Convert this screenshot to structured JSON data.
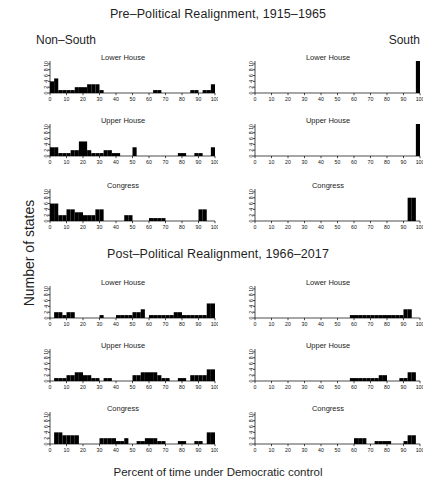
{
  "figure": {
    "ylabel": "Number of states",
    "xlabel": "Percent of time under Democratic control",
    "sections": [
      {
        "title": "Pre–Political Realignment, 1915–1965"
      },
      {
        "title": "Post–Political Realignment, 1966–2017"
      }
    ],
    "column_labels": {
      "left": "Non–South",
      "right": "South"
    },
    "panel_titles": {
      "lower": "Lower House",
      "upper": "Upper House",
      "congress": "Congress"
    }
  },
  "chart_data": [
    {
      "type": "bar",
      "title": "Lower House",
      "subtitle": "Pre–Political Realignment, 1915–1965 — Non–South",
      "xlabel": "Percent of time under Democratic control",
      "ylabel": "Number of states",
      "xlim": [
        0,
        100
      ],
      "ylim": [
        0,
        11
      ],
      "xticks": [
        0,
        10,
        20,
        30,
        40,
        50,
        60,
        70,
        80,
        90,
        100
      ],
      "yticks": [
        0,
        2,
        4,
        6,
        8,
        10
      ],
      "grid": false,
      "bin_width": 2.5,
      "bins": [
        0,
        2.5,
        5,
        7.5,
        10,
        12.5,
        15,
        17.5,
        20,
        22.5,
        25,
        27.5,
        30,
        32.5,
        35,
        37.5,
        40,
        42.5,
        45,
        47.5,
        50,
        52.5,
        55,
        57.5,
        60,
        62.5,
        65,
        67.5,
        70,
        72.5,
        75,
        77.5,
        80,
        82.5,
        85,
        87.5,
        90,
        92.5,
        95,
        97.5
      ],
      "values": [
        4,
        5,
        1,
        1,
        1,
        1,
        2,
        2,
        2,
        3,
        3,
        3,
        1,
        0,
        0,
        0,
        0,
        0,
        0,
        0,
        0,
        0,
        0,
        0,
        0,
        1,
        1,
        0,
        0,
        0,
        0,
        0,
        0,
        0,
        1,
        1,
        0,
        1,
        1,
        3
      ]
    },
    {
      "type": "bar",
      "title": "Lower House",
      "subtitle": "Pre–Political Realignment, 1915–1965 — South",
      "xlabel": "Percent of time under Democratic control",
      "ylabel": "Number of states",
      "xlim": [
        0,
        100
      ],
      "ylim": [
        0,
        11
      ],
      "xticks": [
        0,
        10,
        20,
        30,
        40,
        50,
        60,
        70,
        80,
        90,
        100
      ],
      "yticks": [
        0,
        2,
        4,
        6,
        8,
        10
      ],
      "grid": false,
      "bin_width": 2.5,
      "bins": [
        0,
        2.5,
        5,
        7.5,
        10,
        12.5,
        15,
        17.5,
        20,
        22.5,
        25,
        27.5,
        30,
        32.5,
        35,
        37.5,
        40,
        42.5,
        45,
        47.5,
        50,
        52.5,
        55,
        57.5,
        60,
        62.5,
        65,
        67.5,
        70,
        72.5,
        75,
        77.5,
        80,
        82.5,
        85,
        87.5,
        90,
        92.5,
        95,
        97.5
      ],
      "values": [
        0,
        0,
        0,
        0,
        0,
        0,
        0,
        0,
        0,
        0,
        0,
        0,
        0,
        0,
        0,
        0,
        0,
        0,
        0,
        0,
        0,
        0,
        0,
        0,
        0,
        0,
        0,
        0,
        0,
        0,
        0,
        0,
        0,
        0,
        0,
        0,
        0,
        0,
        0,
        11
      ]
    },
    {
      "type": "bar",
      "title": "Upper House",
      "subtitle": "Pre–Political Realignment, 1915–1965 — Non–South",
      "xlabel": "Percent of time under Democratic control",
      "ylabel": "Number of states",
      "xlim": [
        0,
        100
      ],
      "ylim": [
        0,
        11
      ],
      "xticks": [
        0,
        10,
        20,
        30,
        40,
        50,
        60,
        70,
        80,
        90,
        100
      ],
      "yticks": [
        0,
        2,
        4,
        6,
        8,
        10
      ],
      "grid": false,
      "bin_width": 2.5,
      "bins": [
        0,
        2.5,
        5,
        7.5,
        10,
        12.5,
        15,
        17.5,
        20,
        22.5,
        25,
        27.5,
        30,
        32.5,
        35,
        37.5,
        40,
        42.5,
        45,
        47.5,
        50,
        52.5,
        55,
        57.5,
        60,
        62.5,
        65,
        67.5,
        70,
        72.5,
        75,
        77.5,
        80,
        82.5,
        85,
        87.5,
        90,
        92.5,
        95,
        97.5
      ],
      "values": [
        3,
        3,
        1,
        1,
        1,
        2,
        2,
        5,
        5,
        2,
        1,
        1,
        1,
        2,
        2,
        1,
        1,
        0,
        0,
        0,
        3,
        0,
        0,
        0,
        0,
        0,
        0,
        0,
        0,
        0,
        0,
        1,
        1,
        0,
        0,
        1,
        1,
        0,
        0,
        3
      ]
    },
    {
      "type": "bar",
      "title": "Upper House",
      "subtitle": "Pre–Political Realignment, 1915–1965 — South",
      "xlabel": "Percent of time under Democratic control",
      "ylabel": "Number of states",
      "xlim": [
        0,
        100
      ],
      "ylim": [
        0,
        11
      ],
      "xticks": [
        0,
        10,
        20,
        30,
        40,
        50,
        60,
        70,
        80,
        90,
        100
      ],
      "yticks": [
        0,
        2,
        4,
        6,
        8,
        10
      ],
      "grid": false,
      "bin_width": 2.5,
      "bins": [
        0,
        2.5,
        5,
        7.5,
        10,
        12.5,
        15,
        17.5,
        20,
        22.5,
        25,
        27.5,
        30,
        32.5,
        35,
        37.5,
        40,
        42.5,
        45,
        47.5,
        50,
        52.5,
        55,
        57.5,
        60,
        62.5,
        65,
        67.5,
        70,
        72.5,
        75,
        77.5,
        80,
        82.5,
        85,
        87.5,
        90,
        92.5,
        95,
        97.5
      ],
      "values": [
        0,
        0,
        0,
        0,
        0,
        0,
        0,
        0,
        0,
        0,
        0,
        0,
        0,
        0,
        0,
        0,
        0,
        0,
        0,
        0,
        0,
        0,
        0,
        0,
        0,
        0,
        0,
        0,
        0,
        0,
        0,
        0,
        0,
        0,
        0,
        0,
        0,
        0,
        0,
        11
      ]
    },
    {
      "type": "bar",
      "title": "Congress",
      "subtitle": "Pre–Political Realignment, 1915–1965 — Non–South",
      "xlabel": "Percent of time under Democratic control",
      "ylabel": "Number of states",
      "xlim": [
        0,
        100
      ],
      "ylim": [
        0,
        11
      ],
      "xticks": [
        0,
        10,
        20,
        30,
        40,
        50,
        60,
        70,
        80,
        90,
        100
      ],
      "yticks": [
        0,
        2,
        4,
        6,
        8,
        10
      ],
      "grid": false,
      "bin_width": 2.5,
      "bins": [
        0,
        2.5,
        5,
        7.5,
        10,
        12.5,
        15,
        17.5,
        20,
        22.5,
        25,
        27.5,
        30,
        32.5,
        35,
        37.5,
        40,
        42.5,
        45,
        47.5,
        50,
        52.5,
        55,
        57.5,
        60,
        62.5,
        65,
        67.5,
        70,
        72.5,
        75,
        77.5,
        80,
        82.5,
        85,
        87.5,
        90,
        92.5,
        95,
        97.5
      ],
      "values": [
        6,
        6,
        2,
        2,
        4,
        4,
        3,
        3,
        2,
        2,
        2,
        4,
        4,
        0,
        0,
        0,
        0,
        0,
        2,
        2,
        0,
        0,
        0,
        0,
        1,
        1,
        1,
        1,
        0,
        0,
        0,
        0,
        0,
        0,
        0,
        0,
        4,
        4,
        0,
        0
      ]
    },
    {
      "type": "bar",
      "title": "Congress",
      "subtitle": "Pre–Political Realignment, 1915–1965 — South",
      "xlabel": "Percent of time under Democratic control",
      "ylabel": "Number of states",
      "xlim": [
        0,
        100
      ],
      "ylim": [
        0,
        11
      ],
      "xticks": [
        0,
        10,
        20,
        30,
        40,
        50,
        60,
        70,
        80,
        90,
        100
      ],
      "yticks": [
        0,
        2,
        4,
        6,
        8,
        10
      ],
      "grid": false,
      "bin_width": 2.5,
      "bins": [
        0,
        2.5,
        5,
        7.5,
        10,
        12.5,
        15,
        17.5,
        20,
        22.5,
        25,
        27.5,
        30,
        32.5,
        35,
        37.5,
        40,
        42.5,
        45,
        47.5,
        50,
        52.5,
        55,
        57.5,
        60,
        62.5,
        65,
        67.5,
        70,
        72.5,
        75,
        77.5,
        80,
        82.5,
        85,
        87.5,
        90,
        92.5,
        95,
        97.5
      ],
      "values": [
        0,
        0,
        0,
        0,
        0,
        0,
        0,
        0,
        0,
        0,
        0,
        0,
        0,
        0,
        0,
        0,
        0,
        0,
        0,
        0,
        0,
        0,
        0,
        0,
        0,
        0,
        0,
        0,
        0,
        0,
        0,
        0,
        0,
        0,
        0,
        0,
        0,
        8,
        8,
        0
      ]
    },
    {
      "type": "bar",
      "title": "Lower House",
      "subtitle": "Post–Political Realignment, 1966–2017 — Non–South",
      "xlabel": "Percent of time under Democratic control",
      "ylabel": "Number of states",
      "xlim": [
        0,
        100
      ],
      "ylim": [
        0,
        11
      ],
      "xticks": [
        0,
        10,
        20,
        30,
        40,
        50,
        60,
        70,
        80,
        90,
        100
      ],
      "yticks": [
        0,
        2,
        4,
        6,
        8,
        10
      ],
      "grid": false,
      "bin_width": 2.5,
      "bins": [
        0,
        2.5,
        5,
        7.5,
        10,
        12.5,
        15,
        17.5,
        20,
        22.5,
        25,
        27.5,
        30,
        32.5,
        35,
        37.5,
        40,
        42.5,
        45,
        47.5,
        50,
        52.5,
        55,
        57.5,
        60,
        62.5,
        65,
        67.5,
        70,
        72.5,
        75,
        77.5,
        80,
        82.5,
        85,
        87.5,
        90,
        92.5,
        95,
        97.5
      ],
      "values": [
        0,
        2,
        2,
        1,
        2,
        2,
        0,
        0,
        0,
        0,
        0,
        0,
        1,
        0,
        0,
        0,
        1,
        1,
        1,
        1,
        2,
        2,
        3,
        0,
        1,
        1,
        1,
        1,
        1,
        1,
        2,
        2,
        1,
        1,
        1,
        1,
        1,
        1,
        5,
        5
      ]
    },
    {
      "type": "bar",
      "title": "Lower House",
      "subtitle": "Post–Political Realignment, 1966–2017 — South",
      "xlabel": "Percent of time under Democratic control",
      "ylabel": "Number of states",
      "xlim": [
        0,
        100
      ],
      "ylim": [
        0,
        11
      ],
      "xticks": [
        0,
        10,
        20,
        30,
        40,
        50,
        60,
        70,
        80,
        90,
        100
      ],
      "yticks": [
        0,
        2,
        4,
        6,
        8,
        10
      ],
      "grid": false,
      "bin_width": 2.5,
      "bins": [
        0,
        2.5,
        5,
        7.5,
        10,
        12.5,
        15,
        17.5,
        20,
        22.5,
        25,
        27.5,
        30,
        32.5,
        35,
        37.5,
        40,
        42.5,
        45,
        47.5,
        50,
        52.5,
        55,
        57.5,
        60,
        62.5,
        65,
        67.5,
        70,
        72.5,
        75,
        77.5,
        80,
        82.5,
        85,
        87.5,
        90,
        92.5,
        95,
        97.5
      ],
      "values": [
        0,
        0,
        0,
        0,
        0,
        0,
        0,
        0,
        0,
        0,
        0,
        0,
        0,
        0,
        0,
        0,
        0,
        0,
        0,
        0,
        0,
        0,
        0,
        1,
        1,
        1,
        1,
        1,
        1,
        1,
        1,
        1,
        1,
        1,
        1,
        1,
        3,
        3,
        0,
        0
      ]
    },
    {
      "type": "bar",
      "title": "Upper House",
      "subtitle": "Post–Political Realignment, 1966–2017 — Non–South",
      "xlabel": "Percent of time under Democratic control",
      "ylabel": "Number of states",
      "xlim": [
        0,
        100
      ],
      "ylim": [
        0,
        11
      ],
      "xticks": [
        0,
        10,
        20,
        30,
        40,
        50,
        60,
        70,
        80,
        90,
        100
      ],
      "yticks": [
        0,
        2,
        4,
        6,
        8,
        10
      ],
      "grid": false,
      "bin_width": 2.5,
      "bins": [
        0,
        2.5,
        5,
        7.5,
        10,
        12.5,
        15,
        17.5,
        20,
        22.5,
        25,
        27.5,
        30,
        32.5,
        35,
        37.5,
        40,
        42.5,
        45,
        47.5,
        50,
        52.5,
        55,
        57.5,
        60,
        62.5,
        65,
        67.5,
        70,
        72.5,
        75,
        77.5,
        80,
        82.5,
        85,
        87.5,
        90,
        92.5,
        95,
        97.5
      ],
      "values": [
        0,
        1,
        1,
        1,
        2,
        2,
        3,
        3,
        2,
        2,
        1,
        1,
        0,
        1,
        1,
        0,
        0,
        0,
        0,
        0,
        2,
        2,
        3,
        3,
        3,
        3,
        2,
        1,
        1,
        0,
        0,
        1,
        1,
        0,
        2,
        2,
        2,
        2,
        4,
        4
      ]
    },
    {
      "type": "bar",
      "title": "Upper House",
      "subtitle": "Post–Political Realignment, 1966–2017 — South",
      "xlabel": "Percent of time under Democratic control",
      "ylabel": "Number of states",
      "xlim": [
        0,
        100
      ],
      "ylim": [
        0,
        11
      ],
      "xticks": [
        0,
        10,
        20,
        30,
        40,
        50,
        60,
        70,
        80,
        90,
        100
      ],
      "yticks": [
        0,
        2,
        4,
        6,
        8,
        10
      ],
      "grid": false,
      "bin_width": 2.5,
      "bins": [
        0,
        2.5,
        5,
        7.5,
        10,
        12.5,
        15,
        17.5,
        20,
        22.5,
        25,
        27.5,
        30,
        32.5,
        35,
        37.5,
        40,
        42.5,
        45,
        47.5,
        50,
        52.5,
        55,
        57.5,
        60,
        62.5,
        65,
        67.5,
        70,
        72.5,
        75,
        77.5,
        80,
        82.5,
        85,
        87.5,
        90,
        92.5,
        95,
        97.5
      ],
      "values": [
        0,
        0,
        0,
        0,
        0,
        0,
        0,
        0,
        0,
        0,
        0,
        0,
        0,
        0,
        0,
        0,
        0,
        0,
        0,
        0,
        0,
        0,
        0,
        1,
        1,
        1,
        1,
        1,
        1,
        1,
        2,
        2,
        0,
        0,
        0,
        1,
        1,
        3,
        3,
        0
      ]
    },
    {
      "type": "bar",
      "title": "Congress",
      "subtitle": "Post–Political Realignment, 1966–2017 — Non–South",
      "xlabel": "Percent of time under Democratic control",
      "ylabel": "Number of states",
      "xlim": [
        0,
        100
      ],
      "ylim": [
        0,
        11
      ],
      "xticks": [
        0,
        10,
        20,
        30,
        40,
        50,
        60,
        70,
        80,
        90,
        100
      ],
      "yticks": [
        0,
        2,
        4,
        6,
        8,
        10
      ],
      "grid": false,
      "bin_width": 2.5,
      "bins": [
        0,
        2.5,
        5,
        7.5,
        10,
        12.5,
        15,
        17.5,
        20,
        22.5,
        25,
        27.5,
        30,
        32.5,
        35,
        37.5,
        40,
        42.5,
        45,
        47.5,
        50,
        52.5,
        55,
        57.5,
        60,
        62.5,
        65,
        67.5,
        70,
        72.5,
        75,
        77.5,
        80,
        82.5,
        85,
        87.5,
        90,
        92.5,
        95,
        97.5
      ],
      "values": [
        0,
        4,
        4,
        3,
        3,
        3,
        3,
        0,
        0,
        0,
        0,
        0,
        2,
        2,
        2,
        2,
        1,
        1,
        2,
        0,
        0,
        1,
        1,
        2,
        2,
        2,
        1,
        1,
        0,
        0,
        0,
        1,
        1,
        0,
        0,
        1,
        1,
        0,
        4,
        4
      ]
    },
    {
      "type": "bar",
      "title": "Congress",
      "subtitle": "Post–Political Realignment, 1966–2017 — South",
      "xlabel": "Percent of time under Democratic control",
      "ylabel": "Number of states",
      "xlim": [
        0,
        100
      ],
      "ylim": [
        0,
        11
      ],
      "xticks": [
        0,
        10,
        20,
        30,
        40,
        50,
        60,
        70,
        80,
        90,
        100
      ],
      "yticks": [
        0,
        2,
        4,
        6,
        8,
        10
      ],
      "grid": false,
      "bin_width": 2.5,
      "bins": [
        0,
        2.5,
        5,
        7.5,
        10,
        12.5,
        15,
        17.5,
        20,
        22.5,
        25,
        27.5,
        30,
        32.5,
        35,
        37.5,
        40,
        42.5,
        45,
        47.5,
        50,
        52.5,
        55,
        57.5,
        60,
        62.5,
        65,
        67.5,
        70,
        72.5,
        75,
        77.5,
        80,
        82.5,
        85,
        87.5,
        90,
        92.5,
        95,
        97.5
      ],
      "values": [
        0,
        0,
        0,
        0,
        0,
        0,
        0,
        0,
        0,
        0,
        0,
        0,
        0,
        0,
        0,
        0,
        0,
        0,
        0,
        0,
        0,
        0,
        0,
        0,
        2,
        2,
        2,
        0,
        0,
        1,
        1,
        1,
        1,
        0,
        0,
        0,
        1,
        3,
        3,
        0
      ]
    }
  ]
}
